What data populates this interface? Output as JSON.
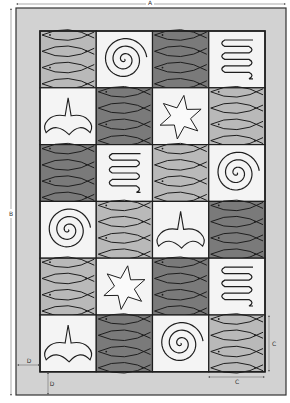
{
  "diagram": {
    "type": "rug-layout",
    "colors": {
      "background": "#ffffff",
      "panel_fill": "#d2d2d2",
      "panel_border": "#333333",
      "fish_light": "#b9b9b9",
      "fish_dark": "#7a7a7a",
      "motif_tile": "#f4f4f4",
      "stroke": "#1e1e1e",
      "dimension_line": "#555555"
    },
    "dimensions": {
      "width_label": "A",
      "height_label": "B",
      "tile_width_label": "C",
      "tile_height_label": "C",
      "border_side_label": "D",
      "border_bottom_label": "D"
    },
    "grid": {
      "columns": 4,
      "rows": 6,
      "tiles": [
        [
          "fish-light",
          "spiral",
          "fish-dark",
          "serpentine"
        ],
        [
          "bird",
          "fish-dark",
          "star",
          "fish-light"
        ],
        [
          "fish-dark",
          "serpentine",
          "fish-light",
          "spiral"
        ],
        [
          "spiral",
          "fish-light",
          "bird",
          "fish-dark"
        ],
        [
          "fish-light",
          "star",
          "fish-dark",
          "serpentine"
        ],
        [
          "bird",
          "fish-dark",
          "spiral",
          "fish-light"
        ]
      ]
    }
  }
}
